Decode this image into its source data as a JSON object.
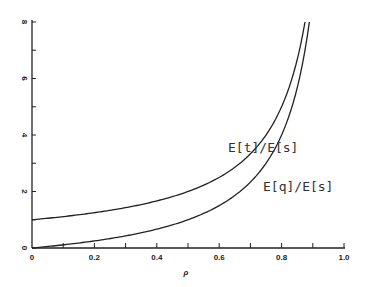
{
  "chart_data": {
    "type": "line",
    "title": "",
    "xlabel": "ρ",
    "ylabel": "",
    "xlim": [
      0,
      1.0
    ],
    "ylim": [
      0,
      8
    ],
    "grid": false,
    "x_ticks": [
      "0",
      "0.2",
      "0.4",
      "0.6",
      "0.8",
      "1.0"
    ],
    "y_ticks": [
      "0",
      "2",
      "4",
      "6",
      "8"
    ],
    "series": [
      {
        "name": "E[t]/E[s]",
        "x": [
          0,
          0.1,
          0.2,
          0.3,
          0.4,
          0.5,
          0.6,
          0.7,
          0.75,
          0.8,
          0.85,
          0.875
        ],
        "values": [
          1.0,
          1.11,
          1.25,
          1.43,
          1.67,
          2.0,
          2.5,
          3.33,
          4.0,
          5.0,
          6.67,
          8.0
        ]
      },
      {
        "name": "E[q]/E[s]",
        "x": [
          0,
          0.1,
          0.2,
          0.3,
          0.4,
          0.5,
          0.6,
          0.7,
          0.75,
          0.8,
          0.85,
          0.889
        ],
        "values": [
          0,
          0.11,
          0.25,
          0.43,
          0.67,
          1.0,
          1.5,
          2.33,
          3.0,
          4.0,
          5.67,
          8.0
        ]
      }
    ],
    "annotations": [
      {
        "text": "E[t]/E[s]",
        "x": 0.6,
        "y": 4.2
      },
      {
        "text": "E[q]/E[s]",
        "x": 0.73,
        "y": 2.3
      }
    ]
  }
}
